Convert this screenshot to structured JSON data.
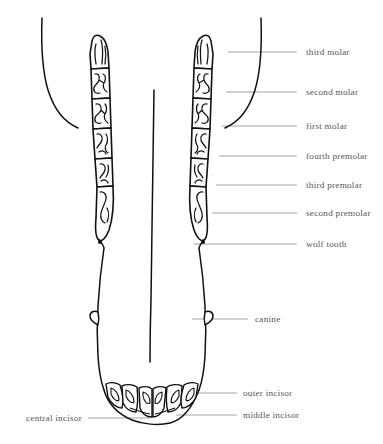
{
  "figure": {
    "background_color": "#ffffff",
    "ink_color": "#000000",
    "label_color": "#585552",
    "leader_color": "#8d8a87"
  },
  "labels": {
    "third_molar": "third molar",
    "second_molar": "second molar",
    "first_molar": "first molar",
    "fourth_premolar": "fourth premolar",
    "third_premolar": "third premolar",
    "second_premolar": "second premolar",
    "wolf_tooth": "wolf tooth",
    "canine": "canine",
    "outer_incisor": "outer incisor",
    "middle_incisor": "middle incisor",
    "central_incisor": "central incisor"
  },
  "label_positions": {
    "third_molar": {
      "x": 306,
      "y": 48,
      "side": "right"
    },
    "second_molar": {
      "x": 306,
      "y": 88,
      "side": "right"
    },
    "first_molar": {
      "x": 306,
      "y": 122,
      "side": "right"
    },
    "fourth_premolar": {
      "x": 306,
      "y": 153,
      "side": "right"
    },
    "third_premolar": {
      "x": 306,
      "y": 182,
      "side": "right"
    },
    "second_premolar": {
      "x": 306,
      "y": 210,
      "side": "right"
    },
    "wolf_tooth": {
      "x": 306,
      "y": 241,
      "side": "right"
    },
    "canine": {
      "x": 255,
      "y": 316,
      "side": "right"
    },
    "outer_incisor": {
      "x": 243,
      "y": 390,
      "side": "right"
    },
    "middle_incisor": {
      "x": 243,
      "y": 412,
      "side": "right"
    },
    "central_incisor": {
      "x": 26,
      "y": 415,
      "side": "left"
    }
  },
  "leaders": [
    {
      "name": "third-molar-leader",
      "x1": 228,
      "y1": 52,
      "x2": 297,
      "y2": 52
    },
    {
      "name": "second-molar-leader",
      "x1": 226,
      "y1": 92,
      "x2": 297,
      "y2": 92
    },
    {
      "name": "first-molar-leader",
      "x1": 222,
      "y1": 126,
      "x2": 297,
      "y2": 126
    },
    {
      "name": "fourth-premolar-leader",
      "x1": 219,
      "y1": 156,
      "x2": 297,
      "y2": 156
    },
    {
      "name": "third-premolar-leader",
      "x1": 216,
      "y1": 185,
      "x2": 297,
      "y2": 185
    },
    {
      "name": "second-premolar-leader",
      "x1": 212,
      "y1": 213,
      "x2": 297,
      "y2": 213
    },
    {
      "name": "wolf-tooth-leader",
      "x1": 194,
      "y1": 244,
      "x2": 297,
      "y2": 244
    },
    {
      "name": "canine-leader",
      "x1": 192,
      "y1": 319,
      "x2": 248,
      "y2": 319
    },
    {
      "name": "outer-incisor-leader",
      "x1": 183,
      "y1": 393,
      "x2": 237,
      "y2": 393
    },
    {
      "name": "middle-incisor-leader",
      "x1": 176,
      "y1": 415,
      "x2": 237,
      "y2": 415
    },
    {
      "name": "central-incisor-leader",
      "x1": 88,
      "y1": 418,
      "x2": 150,
      "y2": 418
    }
  ],
  "anatomy": {
    "rows": [
      {
        "side": "left",
        "teeth": [
          "third molar",
          "second molar",
          "first molar",
          "fourth premolar",
          "third premolar",
          "second premolar"
        ]
      },
      {
        "side": "right",
        "teeth": [
          "third molar",
          "second molar",
          "first molar",
          "fourth premolar",
          "third premolar",
          "second premolar"
        ]
      }
    ],
    "canines": 2,
    "incisors": [
      "outer incisor",
      "middle incisor",
      "central incisor"
    ],
    "wolf_teeth": 2
  }
}
